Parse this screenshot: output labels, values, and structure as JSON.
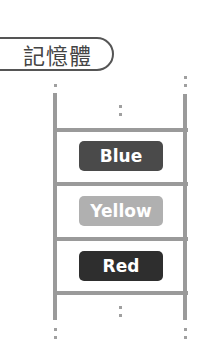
{
  "title": "記憶體",
  "memory": {
    "cells": [
      {
        "label": "Blue",
        "color": "#4a4a4a"
      },
      {
        "label": "Yellow",
        "color": "#b0b0b0"
      },
      {
        "label": "Red",
        "color": "#2e2e2e"
      }
    ]
  },
  "colors": {
    "rail": "#9a9a9a",
    "title_border": "#555555",
    "title_text": "#444444"
  }
}
